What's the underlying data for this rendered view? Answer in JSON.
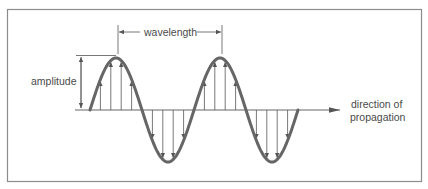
{
  "figure": {
    "labels": {
      "wavelength": "wavelength",
      "amplitude": "amplitude",
      "direction_line1": "direction of",
      "direction_line2": "propagation"
    },
    "colors": {
      "frame": "#8c8c8c",
      "wave": "#666666",
      "lines": "#555555",
      "text": "#4a4a4a",
      "background": "#ffffff"
    },
    "geometry": {
      "baseline_y": 110,
      "wave_start_x": 90,
      "half_wavelength_px": 52,
      "amplitude_px": 52,
      "cycles": 2
    }
  }
}
